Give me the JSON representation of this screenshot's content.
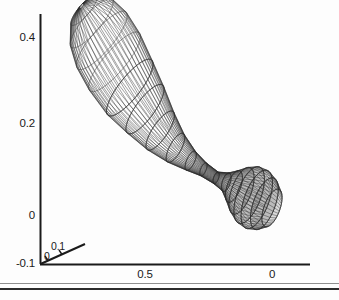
{
  "figure": {
    "background_color": "#fdfdfd",
    "axis_color": "#1a1a1a",
    "mesh_color": "#2a2a2a",
    "divider_color": "#2b2b2b"
  },
  "chart_data": {
    "type": "line",
    "title": "",
    "subtitle": "",
    "xlabel": "",
    "ylabel": "",
    "zlabel": "",
    "grid": false,
    "legend": null,
    "plot_style": "3d-wireframe-mesh-surface",
    "xaxis": {
      "ticks": [
        0.5,
        0
      ],
      "tick_labels": [
        "0.5",
        "0"
      ],
      "direction": "descending",
      "range": [
        0.75,
        -0.1
      ]
    },
    "yaxis": {
      "ticks": [
        0.4,
        0.2,
        0,
        -0.1
      ],
      "tick_labels": [
        "0.4",
        "0.2",
        "0",
        "-0.1"
      ],
      "direction": "ascending",
      "range": [
        -0.1,
        0.48
      ]
    },
    "zaxis": {
      "ticks": [
        0,
        0.1
      ],
      "tick_labels": [
        "0",
        "0.1"
      ],
      "direction": "ascending",
      "range": [
        0,
        0.12
      ]
    },
    "surface": {
      "profile_comment": "radius profile along the axis of revolution, sampled from x=0 (small lobe) to x=0.75 (large lobe tip)",
      "axis_x": [
        0.0,
        0.03,
        0.06,
        0.09,
        0.12,
        0.15,
        0.18,
        0.22,
        0.27,
        0.32,
        0.38,
        0.44,
        0.5,
        0.56,
        0.62,
        0.67,
        0.71,
        0.74,
        0.75
      ],
      "axis_y": [
        0.0,
        0.01,
        0.02,
        0.03,
        0.04,
        0.05,
        0.06,
        0.07,
        0.09,
        0.11,
        0.14,
        0.18,
        0.23,
        0.28,
        0.34,
        0.39,
        0.43,
        0.46,
        0.47
      ],
      "radius": [
        0.045,
        0.062,
        0.07,
        0.068,
        0.056,
        0.038,
        0.022,
        0.014,
        0.016,
        0.024,
        0.038,
        0.055,
        0.072,
        0.086,
        0.094,
        0.092,
        0.078,
        0.048,
        0.008
      ],
      "mesh_lines_u": 48,
      "mesh_lines_v": 40
    },
    "annotations": []
  },
  "ticks": {
    "y": [
      {
        "label": "0.4"
      },
      {
        "label": "0.2"
      },
      {
        "label": "0"
      },
      {
        "label": "-0.1"
      }
    ],
    "x": [
      {
        "label": "0.5"
      },
      {
        "label": "0"
      }
    ],
    "z": [
      {
        "label": "0"
      },
      {
        "label": "0.1"
      }
    ]
  }
}
